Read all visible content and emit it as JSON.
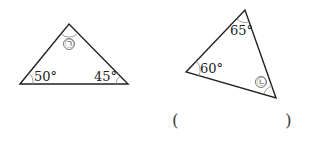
{
  "diagram": {
    "triangle_left": {
      "angle_top": "㉠",
      "angle_bottom_left": "50°",
      "angle_bottom_right": "45°"
    },
    "triangle_right": {
      "angle_top": "65°",
      "angle_left": "60°",
      "angle_bottom_right": "㉡"
    },
    "answer": {
      "open_paren": "(",
      "close_paren": ")",
      "value": ""
    }
  },
  "colors": {
    "line": "#222222",
    "arc": "#888888",
    "background": "#ffffff"
  }
}
